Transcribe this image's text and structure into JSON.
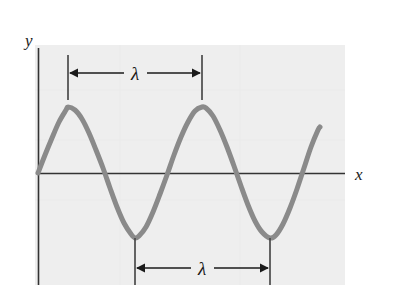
{
  "figure": {
    "background_color": "#ffffff",
    "plot_background_color": "#eeeeee",
    "plot_area": {
      "x": 35,
      "y": 45,
      "width": 310,
      "height": 240
    },
    "axes": {
      "x_axis": {
        "label": "x",
        "label_x": 357,
        "label_y": 180,
        "color": "#333333",
        "line_y": 173,
        "line_x_start": 38,
        "line_x_end": 345
      },
      "y_axis": {
        "label": "y",
        "label_x": 25,
        "label_y": 46,
        "color": "#333333",
        "line_x": 38,
        "line_y_start": 48,
        "line_y_end": 285
      }
    },
    "annotations": [
      {
        "name": "wavelength-top",
        "symbol": "λ",
        "symbol_x": 135,
        "symbol_y": 80,
        "arrow_y": 73,
        "tick_left_x": 68,
        "tick_right_x": 202,
        "tick_y_top": 55,
        "tick_y_bottom": 100,
        "measured_from": "crest",
        "measured_to": "crest"
      },
      {
        "name": "wavelength-bottom",
        "symbol": "λ",
        "symbol_x": 202,
        "symbol_y": 275,
        "arrow_y": 268,
        "tick_left_x": 135,
        "tick_right_x": 270,
        "tick_y_top": 238,
        "tick_y_bottom": 285,
        "measured_from": "trough",
        "measured_to": "trough"
      }
    ]
  },
  "chart_data": {
    "type": "line",
    "title": "",
    "xlabel": "x",
    "ylabel": "y",
    "curve_color": "#8a8a8a",
    "curve_width": 5,
    "grid": false,
    "legend": null,
    "function": "y = A sin(2πx/λ)",
    "amplitude_px": 66,
    "wavelength_px": 135,
    "baseline_y_px": 173,
    "x_start_px": 38,
    "x_end_px": 320,
    "annotations": [
      "λ",
      "λ"
    ],
    "series": [
      {
        "name": "wave",
        "description": "sine wave starting at origin, two full crests and two troughs, ending mid-rise",
        "points_px": [
          [
            38,
            173
          ],
          [
            45,
            155
          ],
          [
            52,
            138
          ],
          [
            59,
            122
          ],
          [
            66,
            110
          ],
          [
            68,
            107
          ],
          [
            75,
            110
          ],
          [
            82,
            119
          ],
          [
            89,
            133
          ],
          [
            96,
            150
          ],
          [
            103,
            168
          ],
          [
            110,
            188
          ],
          [
            117,
            207
          ],
          [
            124,
            223
          ],
          [
            131,
            234
          ],
          [
            135,
            238
          ],
          [
            139,
            236
          ],
          [
            146,
            227
          ],
          [
            153,
            212
          ],
          [
            160,
            194
          ],
          [
            167,
            175
          ],
          [
            174,
            155
          ],
          [
            181,
            137
          ],
          [
            188,
            122
          ],
          [
            195,
            111
          ],
          [
            202,
            107
          ],
          [
            206,
            108
          ],
          [
            213,
            116
          ],
          [
            220,
            130
          ],
          [
            227,
            147
          ],
          [
            234,
            166
          ],
          [
            241,
            186
          ],
          [
            248,
            205
          ],
          [
            255,
            221
          ],
          [
            262,
            232
          ],
          [
            270,
            238
          ],
          [
            276,
            235
          ],
          [
            283,
            224
          ],
          [
            290,
            208
          ],
          [
            297,
            189
          ],
          [
            304,
            168
          ],
          [
            311,
            147
          ],
          [
            318,
            130
          ],
          [
            320,
            127
          ]
        ]
      }
    ]
  }
}
